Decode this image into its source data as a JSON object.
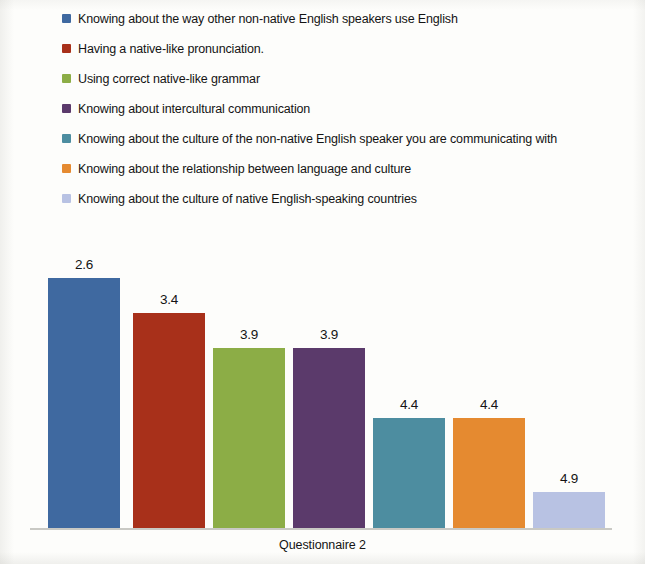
{
  "chart_data": {
    "type": "bar",
    "title": "",
    "subtitle": "",
    "xlabel": "Questionnaire 2",
    "ylabel": "",
    "grid": false,
    "legend_position": "top",
    "axis_visible": {
      "x_line": true,
      "y_line": false,
      "y_ticks": false
    },
    "note": "Bar heights are inverse to the printed values: the lowest value (2.6) is drawn tallest and the highest value (4.9) is drawn shortest, consistent with a mean-rank ordering.",
    "categories": [
      "Knowing about the way other non-native English speakers use English",
      "Having a native-like pronunciation.",
      "Using correct native-like grammar",
      "Knowing about intercultural communication",
      "Knowing about the culture of the non-native English speaker you are communicating with",
      "Knowing about the relationship between language and culture",
      "Knowing about the culture of native English-speaking countries"
    ],
    "values": [
      2.6,
      3.4,
      3.9,
      3.9,
      4.4,
      4.4,
      4.9
    ],
    "value_labels": [
      "2.6",
      "3.4",
      "3.9",
      "3.9",
      "4.4",
      "4.4",
      "4.9"
    ],
    "colors": [
      "#3F69A0",
      "#A8301A",
      "#8CAD46",
      "#5B3A6B",
      "#4D8DA0",
      "#E58A30",
      "#B8C2E3"
    ],
    "bar_pixel_heights": [
      250,
      215,
      180,
      180,
      110,
      110,
      36
    ],
    "bar_pixel_left": [
      48,
      133,
      213,
      293,
      373,
      453,
      533
    ],
    "bar_pixel_width": 72,
    "baseline_y": 528
  },
  "legend": {
    "items": [
      {
        "label": "Knowing about the way other non-native English speakers use English",
        "color": "#3F69A0"
      },
      {
        "label": "Having a native-like pronunciation.",
        "color": "#A8301A"
      },
      {
        "label": "Using correct native-like grammar",
        "color": "#8CAD46"
      },
      {
        "label": "Knowing about intercultural communication",
        "color": "#5B3A6B"
      },
      {
        "label": "Knowing about the culture of the non-native English speaker you are communicating with",
        "color": "#4D8DA0"
      },
      {
        "label": "Knowing about the relationship between language and culture",
        "color": "#E58A30"
      },
      {
        "label": "Knowing about the culture of native English-speaking countries",
        "color": "#B8C2E3"
      }
    ]
  },
  "axis": {
    "x_label": "Questionnaire 2"
  }
}
